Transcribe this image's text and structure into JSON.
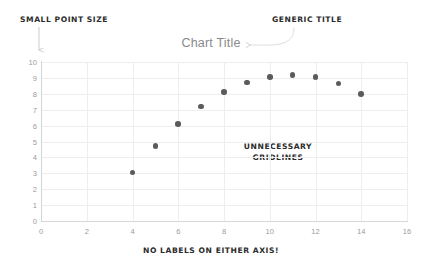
{
  "chart_data": {
    "type": "scatter",
    "title": "Chart Title",
    "xlabel": "",
    "ylabel": "",
    "xlim": [
      0,
      16
    ],
    "ylim": [
      0,
      10
    ],
    "xticks": [
      0,
      2,
      4,
      6,
      8,
      10,
      12,
      14,
      16
    ],
    "yticks": [
      0,
      1,
      2,
      3,
      4,
      5,
      6,
      7,
      8,
      9,
      10
    ],
    "grid": true,
    "legend": null,
    "series": [
      {
        "name": "series-1",
        "marker": "circle",
        "color": "#595b5d",
        "x": [
          4,
          5,
          6,
          7,
          8,
          9,
          10,
          11,
          12,
          13,
          14
        ],
        "y": [
          3.05,
          4.7,
          6.1,
          7.2,
          8.1,
          8.7,
          9.05,
          9.2,
          9.05,
          8.65,
          8.0
        ]
      }
    ],
    "annotations": [
      "SMALL POINT SIZE",
      "GENERIC TITLE",
      "UNNECESSARY GRIDLINES",
      "NO LABELS ON EITHER AXIS!"
    ]
  },
  "chart": {
    "title": "Chart Title",
    "title_color": "#888a8c",
    "grid_color": "#eceef0",
    "axis_color": "#d4d6d8",
    "tick_color": "#9a9c9e",
    "point_color": "#595b5d",
    "background": "#ffffff"
  },
  "annotations": {
    "small_point_size": "SMALL POINT SIZE",
    "generic_title": "GENERIC TITLE",
    "unnecessary_gridlines": "UNNECESSARY GRIDLINES",
    "no_labels": "NO LABELS ON EITHER AXIS!",
    "color": "#2b2b2b"
  }
}
